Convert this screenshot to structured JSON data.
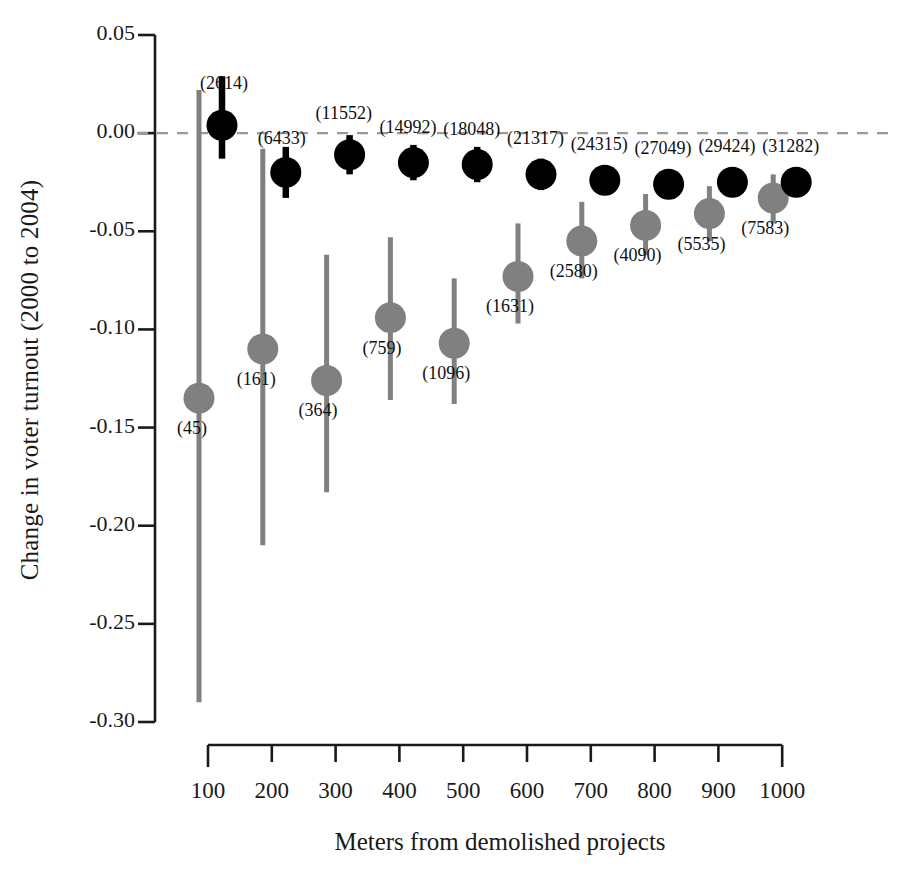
{
  "chart_data": {
    "type": "scatter",
    "title": "",
    "xlabel": "Meters from demolished projects",
    "ylabel": "Change in voter turnout (2000 to 2004)",
    "x_tick_labels": [
      "100",
      "200",
      "300",
      "400",
      "500",
      "600",
      "700",
      "800",
      "900",
      "1000"
    ],
    "x_values": [
      100,
      200,
      300,
      400,
      500,
      600,
      700,
      800,
      900,
      1000
    ],
    "y_tick_labels": [
      "0.05",
      "0.00",
      "-0.05",
      "-0.10",
      "-0.15",
      "-0.20",
      "-0.25",
      "-0.30"
    ],
    "y_tick_values": [
      0.05,
      0.0,
      -0.05,
      -0.1,
      -0.15,
      -0.2,
      -0.25,
      -0.3
    ],
    "ylim": [
      -0.3,
      0.05
    ],
    "xlim": [
      100,
      1000
    ],
    "grid": false,
    "legend": "none",
    "reference_line": {
      "y": 0.0,
      "style": "dashed",
      "color": "#999999"
    },
    "series": [
      {
        "name": "displaced-residents",
        "color": "#808080",
        "marker": "circle",
        "points": [
          {
            "x": 100,
            "estimate": -0.135,
            "ci_low": -0.29,
            "ci_high": 0.022,
            "n_label": "(45)",
            "n": 45
          },
          {
            "x": 200,
            "estimate": -0.11,
            "ci_low": -0.21,
            "ci_high": -0.008,
            "n_label": "(161)",
            "n": 161
          },
          {
            "x": 300,
            "estimate": -0.126,
            "ci_low": -0.183,
            "ci_high": -0.062,
            "n_label": "(364)",
            "n": 364
          },
          {
            "x": 400,
            "estimate": -0.094,
            "ci_low": -0.136,
            "ci_high": -0.053,
            "n_label": "(759)",
            "n": 759
          },
          {
            "x": 500,
            "estimate": -0.107,
            "ci_low": -0.138,
            "ci_high": -0.074,
            "n_label": "(1096)",
            "n": 1096
          },
          {
            "x": 600,
            "estimate": -0.073,
            "ci_low": -0.097,
            "ci_high": -0.046,
            "n_label": "(1631)",
            "n": 1631
          },
          {
            "x": 700,
            "estimate": -0.055,
            "ci_low": -0.074,
            "ci_high": -0.035,
            "n_label": "(2580)",
            "n": 2580
          },
          {
            "x": 800,
            "estimate": -0.047,
            "ci_low": -0.062,
            "ci_high": -0.031,
            "n_label": "(4090)",
            "n": 4090
          },
          {
            "x": 900,
            "estimate": -0.041,
            "ci_low": -0.055,
            "ci_high": -0.027,
            "n_label": "(5535)",
            "n": 5535
          },
          {
            "x": 1000,
            "estimate": -0.033,
            "ci_low": -0.046,
            "ci_high": -0.021,
            "n_label": "(7583)",
            "n": 7583
          }
        ]
      },
      {
        "name": "non-displaced-neighbors",
        "color": "#000000",
        "marker": "circle",
        "points": [
          {
            "x": 100,
            "estimate": 0.004,
            "ci_low": -0.013,
            "ci_high": 0.029,
            "n_label": "(2614)",
            "n": 2614
          },
          {
            "x": 200,
            "estimate": -0.02,
            "ci_low": -0.033,
            "ci_high": -0.007,
            "n_label": "(6433)",
            "n": 6433
          },
          {
            "x": 300,
            "estimate": -0.011,
            "ci_low": -0.021,
            "ci_high": -0.001,
            "n_label": "(11552)",
            "n": 11552
          },
          {
            "x": 400,
            "estimate": -0.015,
            "ci_low": -0.024,
            "ci_high": -0.006,
            "n_label": "(14992)",
            "n": 14992
          },
          {
            "x": 500,
            "estimate": -0.016,
            "ci_low": -0.025,
            "ci_high": -0.007,
            "n_label": "(18048)",
            "n": 18048
          },
          {
            "x": 600,
            "estimate": -0.021,
            "ci_low": -0.029,
            "ci_high": -0.013,
            "n_label": "(21317)",
            "n": 21317
          },
          {
            "x": 700,
            "estimate": -0.024,
            "ci_low": -0.031,
            "ci_high": -0.017,
            "n_label": "(24315)",
            "n": 24315
          },
          {
            "x": 800,
            "estimate": -0.026,
            "ci_low": -0.033,
            "ci_high": -0.019,
            "n_label": "(27049)",
            "n": 27049
          },
          {
            "x": 900,
            "estimate": -0.025,
            "ci_low": -0.032,
            "ci_high": -0.018,
            "n_label": "(29424)",
            "n": 29424
          },
          {
            "x": 1000,
            "estimate": -0.025,
            "ci_low": -0.032,
            "ci_high": -0.018,
            "n_label": "(31282)",
            "n": 31282
          }
        ]
      }
    ],
    "colors": {
      "gray_series": "#808080",
      "black_series": "#000000",
      "axis": "#1a1a1a",
      "reference_line": "#999999",
      "background": "#ffffff"
    }
  }
}
